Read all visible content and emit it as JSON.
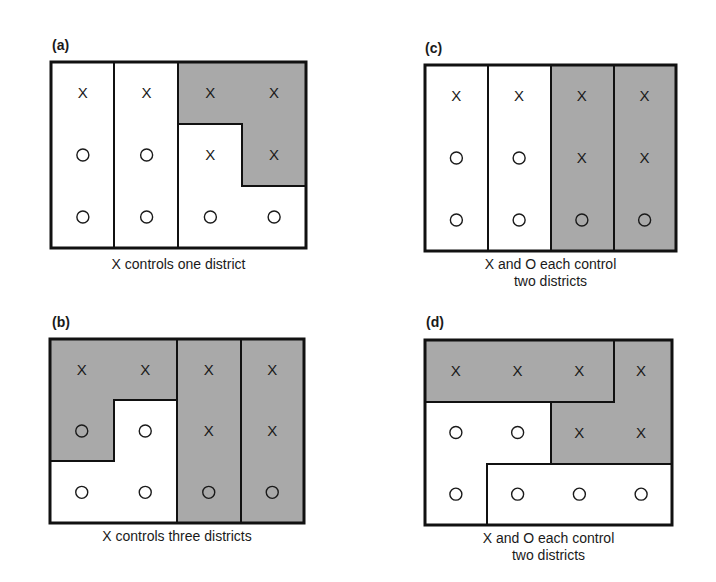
{
  "panels": [
    {
      "id": "a",
      "label": "(a)",
      "caption": [
        "X controls one district"
      ],
      "grid": [
        [
          "X",
          "X",
          "X",
          "X"
        ],
        [
          "O",
          "O",
          "X",
          "X"
        ],
        [
          "O",
          "O",
          "O",
          "O"
        ]
      ],
      "districts": [
        {
          "cells": [
            [
              0,
              0
            ],
            [
              1,
              0
            ],
            [
              2,
              0
            ]
          ],
          "winner": "O",
          "shaded": false
        },
        {
          "cells": [
            [
              0,
              1
            ],
            [
              1,
              1
            ],
            [
              2,
              1
            ]
          ],
          "winner": "O",
          "shaded": false
        },
        {
          "cells": [
            [
              0,
              2
            ],
            [
              0,
              3
            ],
            [
              1,
              3
            ]
          ],
          "winner": "X",
          "shaded": true
        },
        {
          "cells": [
            [
              1,
              2
            ],
            [
              2,
              2
            ],
            [
              2,
              3
            ]
          ],
          "winner": "O",
          "shaded": false
        }
      ]
    },
    {
      "id": "b",
      "label": "(b)",
      "caption": [
        "X controls three districts"
      ],
      "grid": [
        [
          "X",
          "X",
          "X",
          "X"
        ],
        [
          "O",
          "O",
          "X",
          "X"
        ],
        [
          "O",
          "O",
          "O",
          "O"
        ]
      ],
      "districts": [
        {
          "cells": [
            [
              0,
              0
            ],
            [
              0,
              1
            ],
            [
              1,
              0
            ]
          ],
          "winner": "X",
          "shaded": true
        },
        {
          "cells": [
            [
              1,
              1
            ],
            [
              2,
              0
            ],
            [
              2,
              1
            ]
          ],
          "winner": "O",
          "shaded": false
        },
        {
          "cells": [
            [
              0,
              2
            ],
            [
              1,
              2
            ],
            [
              2,
              2
            ]
          ],
          "winner": "X",
          "shaded": true
        },
        {
          "cells": [
            [
              0,
              3
            ],
            [
              1,
              3
            ],
            [
              2,
              3
            ]
          ],
          "winner": "X",
          "shaded": true
        }
      ]
    },
    {
      "id": "c",
      "label": "(c)",
      "caption": [
        "X and O each control",
        "two districts"
      ],
      "grid": [
        [
          "X",
          "X",
          "X",
          "X"
        ],
        [
          "O",
          "O",
          "X",
          "X"
        ],
        [
          "O",
          "O",
          "O",
          "O"
        ]
      ],
      "districts": [
        {
          "cells": [
            [
              0,
              0
            ],
            [
              1,
              0
            ],
            [
              2,
              0
            ]
          ],
          "winner": "O",
          "shaded": false
        },
        {
          "cells": [
            [
              0,
              1
            ],
            [
              1,
              1
            ],
            [
              2,
              1
            ]
          ],
          "winner": "O",
          "shaded": false
        },
        {
          "cells": [
            [
              0,
              2
            ],
            [
              1,
              2
            ],
            [
              2,
              2
            ]
          ],
          "winner": "X",
          "shaded": true
        },
        {
          "cells": [
            [
              0,
              3
            ],
            [
              1,
              3
            ],
            [
              2,
              3
            ]
          ],
          "winner": "X",
          "shaded": true
        }
      ]
    },
    {
      "id": "d",
      "label": "(d)",
      "caption": [
        "X and O each control",
        "two districts"
      ],
      "grid": [
        [
          "X",
          "X",
          "X",
          "X"
        ],
        [
          "O",
          "O",
          "X",
          "X"
        ],
        [
          "O",
          "O",
          "O",
          "O"
        ]
      ],
      "districts": [
        {
          "cells": [
            [
              0,
              0
            ],
            [
              0,
              1
            ],
            [
              0,
              2
            ]
          ],
          "winner": "X",
          "shaded": true
        },
        {
          "cells": [
            [
              0,
              3
            ],
            [
              1,
              2
            ],
            [
              1,
              3
            ]
          ],
          "winner": "X",
          "shaded": true
        },
        {
          "cells": [
            [
              1,
              0
            ],
            [
              1,
              1
            ],
            [
              2,
              0
            ]
          ],
          "winner": "O",
          "shaded": false
        },
        {
          "cells": [
            [
              2,
              1
            ],
            [
              2,
              2
            ],
            [
              2,
              3
            ]
          ],
          "winner": "O",
          "shaded": false
        }
      ]
    }
  ],
  "colors": {
    "shade": "#a9a9a9",
    "background": "#ffffff",
    "line": "#111111"
  }
}
